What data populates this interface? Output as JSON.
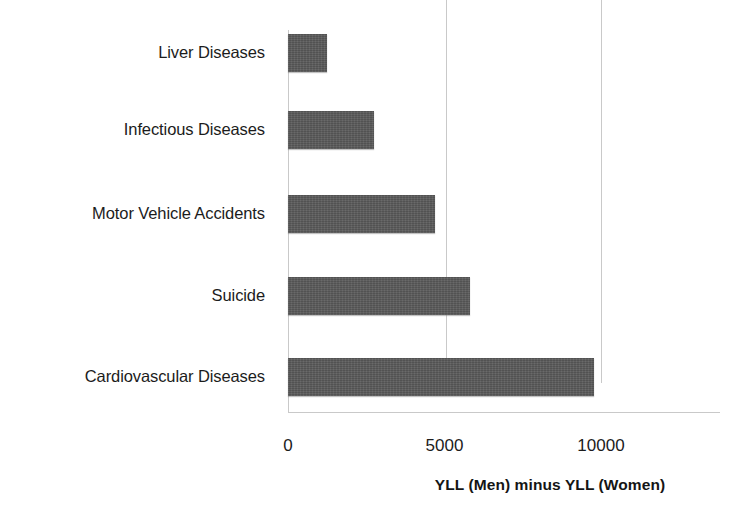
{
  "chart_data": {
    "type": "bar",
    "orientation": "horizontal",
    "title": "",
    "subtitle": "",
    "xlabel": "YLL (Men) minus YLL (Women)",
    "ylabel": "",
    "categories": [
      "Liver Diseases",
      "Infectious Diseases",
      "Motor Vehicle Accidents",
      "Suicide",
      "Cardiovascular Diseases"
    ],
    "values": [
      1240,
      2740,
      4710,
      5800,
      9780
    ],
    "xlim": [
      0,
      13750
    ],
    "xticks": [
      0,
      5000,
      10000
    ],
    "xtick_labels": [
      "0",
      "5000",
      "10000"
    ],
    "grid": "vertical-only",
    "legend": "none",
    "series": [
      {
        "name": "YLL (Men) minus YLL (Women)",
        "color": "#595959",
        "values": [
          1240,
          2740,
          4710,
          5800,
          9780
        ]
      }
    ]
  },
  "style": {
    "bar_color": "#595959",
    "gridline_color": "#c9c9c9",
    "text_color": "#1c1c1c",
    "background": "#ffffff"
  }
}
